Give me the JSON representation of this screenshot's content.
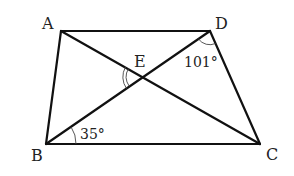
{
  "diagram": {
    "type": "quadrilateral-with-diagonals",
    "points": {
      "A": {
        "label": "A",
        "x": 61,
        "y": 31
      },
      "B": {
        "label": "B",
        "x": 46,
        "y": 144
      },
      "C": {
        "label": "C",
        "x": 260,
        "y": 144
      },
      "D": {
        "label": "D",
        "x": 210,
        "y": 31
      },
      "E": {
        "label": "E",
        "x": 143,
        "y": 77
      }
    },
    "segments": [
      "AD",
      "AB",
      "DC",
      "BC",
      "AC",
      "BD"
    ],
    "angles": [
      {
        "vertex": "D",
        "label": "101°",
        "between": [
          "B",
          "C"
        ]
      },
      {
        "vertex": "B",
        "label": "35°",
        "between": [
          "D",
          "C"
        ]
      },
      {
        "vertex": "E",
        "label": "",
        "marker": "double-arc",
        "between": [
          "A",
          "B"
        ]
      }
    ],
    "line_color": "#111111"
  }
}
